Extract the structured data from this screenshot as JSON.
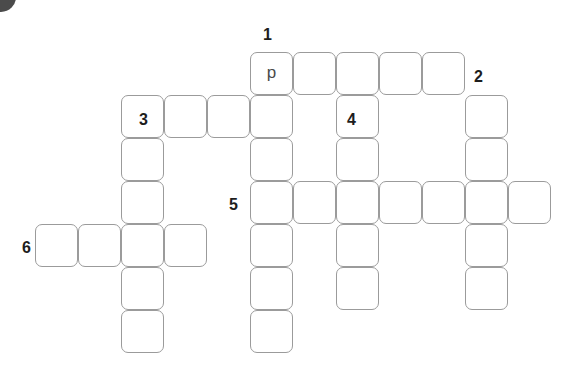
{
  "puzzle": {
    "kind": "crossword-grid",
    "cell_size": 43,
    "grid_origin": {
      "x": 35,
      "y": 52
    },
    "colors": {
      "cell_border": "#9b9b9b",
      "cell_background": "#ffffff",
      "number_color": "#1d1d1d",
      "letter_color": "#3c3c3c",
      "page_background": "#ffffff"
    },
    "decoration": {
      "corner_mark": "partial-dark-circle"
    },
    "clue_numbers": [
      {
        "label": "1",
        "x": 263,
        "y": 27
      },
      {
        "label": "2",
        "x": 474,
        "y": 69
      },
      {
        "label": "3",
        "x": 139,
        "y": 112
      },
      {
        "label": "4",
        "x": 347,
        "y": 112
      },
      {
        "label": "5",
        "x": 229,
        "y": 197
      },
      {
        "label": "6",
        "x": 22,
        "y": 240
      }
    ],
    "entries": [
      {
        "number": "1",
        "direction": "across",
        "length": 5,
        "start_col": 5,
        "start_row": 0
      },
      {
        "number": "1",
        "direction": "down",
        "length": 7,
        "start_col": 5,
        "start_row": 0
      },
      {
        "number": "2",
        "direction": "down",
        "length": 5,
        "start_col": 10,
        "start_row": 1
      },
      {
        "number": "3",
        "direction": "across",
        "length": 4,
        "start_col": 2,
        "start_row": 1
      },
      {
        "number": "3",
        "direction": "down",
        "length": 6,
        "start_col": 2,
        "start_row": 1
      },
      {
        "number": "4",
        "direction": "down",
        "length": 4,
        "start_col": 7,
        "start_row": 1
      },
      {
        "number": "5",
        "direction": "across",
        "length": 7,
        "start_col": 5,
        "start_row": 3
      },
      {
        "number": "6",
        "direction": "across",
        "length": 4,
        "start_col": 0,
        "start_row": 4
      }
    ],
    "cells": [
      {
        "col": 5,
        "row": 0,
        "letter": "p"
      },
      {
        "col": 6,
        "row": 0,
        "letter": ""
      },
      {
        "col": 7,
        "row": 0,
        "letter": ""
      },
      {
        "col": 8,
        "row": 0,
        "letter": ""
      },
      {
        "col": 9,
        "row": 0,
        "letter": ""
      },
      {
        "col": 2,
        "row": 1,
        "letter": ""
      },
      {
        "col": 3,
        "row": 1,
        "letter": ""
      },
      {
        "col": 4,
        "row": 1,
        "letter": ""
      },
      {
        "col": 5,
        "row": 1,
        "letter": ""
      },
      {
        "col": 7,
        "row": 1,
        "letter": ""
      },
      {
        "col": 10,
        "row": 1,
        "letter": ""
      },
      {
        "col": 2,
        "row": 2,
        "letter": ""
      },
      {
        "col": 5,
        "row": 2,
        "letter": ""
      },
      {
        "col": 7,
        "row": 2,
        "letter": ""
      },
      {
        "col": 10,
        "row": 2,
        "letter": ""
      },
      {
        "col": 5,
        "row": 3,
        "letter": ""
      },
      {
        "col": 6,
        "row": 3,
        "letter": ""
      },
      {
        "col": 7,
        "row": 3,
        "letter": ""
      },
      {
        "col": 8,
        "row": 3,
        "letter": ""
      },
      {
        "col": 9,
        "row": 3,
        "letter": ""
      },
      {
        "col": 10,
        "row": 3,
        "letter": ""
      },
      {
        "col": 11,
        "row": 3,
        "letter": ""
      },
      {
        "col": 2,
        "row": 3,
        "letter": ""
      },
      {
        "col": 0,
        "row": 4,
        "letter": ""
      },
      {
        "col": 1,
        "row": 4,
        "letter": ""
      },
      {
        "col": 2,
        "row": 4,
        "letter": ""
      },
      {
        "col": 3,
        "row": 4,
        "letter": ""
      },
      {
        "col": 5,
        "row": 4,
        "letter": ""
      },
      {
        "col": 7,
        "row": 4,
        "letter": ""
      },
      {
        "col": 10,
        "row": 4,
        "letter": ""
      },
      {
        "col": 2,
        "row": 5,
        "letter": ""
      },
      {
        "col": 5,
        "row": 5,
        "letter": ""
      },
      {
        "col": 7,
        "row": 5,
        "letter": ""
      },
      {
        "col": 10,
        "row": 5,
        "letter": ""
      },
      {
        "col": 2,
        "row": 6,
        "letter": ""
      },
      {
        "col": 5,
        "row": 6,
        "letter": ""
      }
    ]
  }
}
